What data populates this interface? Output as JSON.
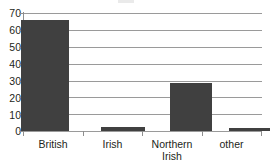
{
  "chart_data": {
    "type": "bar",
    "title": "",
    "subtitle": "",
    "xlabel": "",
    "ylabel": "",
    "categories": [
      "British",
      "Irish",
      "Northern Irish",
      "other"
    ],
    "category_labels_multiline": [
      "British",
      "Irish",
      "Northern\nIrish",
      "other"
    ],
    "values": [
      66,
      2.5,
      28.5,
      1.5
    ],
    "ylim": [
      0,
      70
    ],
    "ytick_step": 10,
    "ytick_labels": [
      "0",
      "10",
      "20",
      "30",
      "40",
      "50",
      "60",
      "70"
    ],
    "ytick_values": [
      0,
      10,
      20,
      30,
      40,
      50,
      60,
      70
    ],
    "grid": true,
    "grid_axis": "y",
    "legend": false,
    "legend_position": "none",
    "bar_color": "#404040",
    "gridline_color": "#9a9a9a",
    "axis_color": "#8e8e8e",
    "text_color": "#231f20",
    "background_color": "#ffffff",
    "series": [
      {
        "name": "",
        "values": [
          66,
          2.5,
          28.5,
          1.5
        ]
      }
    ]
  }
}
